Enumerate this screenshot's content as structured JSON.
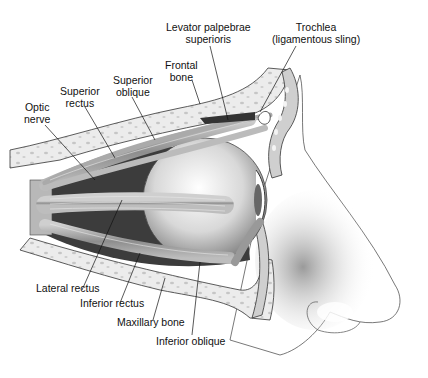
{
  "figure": {
    "labels": {
      "levator": "Levator palpebrae\nsuperioris",
      "trochlea": "Trochlea\n(ligamentous sling)",
      "frontal_bone": "Frontal\nbone",
      "superior_oblique": "Superior\noblique",
      "superior_rectus": "Superior\nrectus",
      "optic_nerve": "Optic\nnerve",
      "lateral_rectus": "Lateral rectus",
      "inferior_rectus": "Inferior rectus",
      "maxillary_bone": "Maxillary bone",
      "inferior_oblique": "Inferior oblique"
    },
    "colors": {
      "ink": "#111111",
      "bone": "#e9e9e9",
      "bone_spots": "#c9c9c9",
      "muscle": "#9a9a9a",
      "orbit_dark": "#3a3a3a",
      "skin": "#d6d6d6"
    }
  }
}
